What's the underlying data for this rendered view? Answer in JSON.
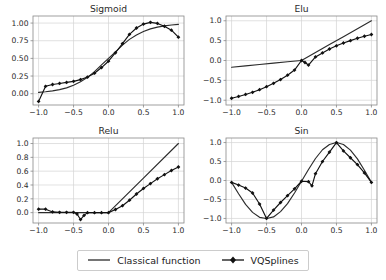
{
  "figure": {
    "background": "#ffffff",
    "line_color": "#2b2b2b",
    "marker_color": "#111111",
    "grid_color": "#d4d4d4",
    "axis_color": "#888888"
  },
  "legend": {
    "entries": [
      {
        "label": "Classical function",
        "style": "line",
        "marker": "none",
        "color": "#2b2b2b"
      },
      {
        "label": "VQSplines",
        "style": "line-marker",
        "marker": "diamond",
        "color": "#111111"
      }
    ]
  },
  "chart_data": [
    {
      "type": "line",
      "title": "Sigmoid",
      "xlabel": "",
      "ylabel": "",
      "xlim": [
        -1.08,
        1.08
      ],
      "ylim": [
        -0.16,
        1.1
      ],
      "xticks": [
        -1.0,
        -0.5,
        0.0,
        0.5,
        1.0
      ],
      "xticklabels": [
        "−1.0",
        "−0.5",
        "0.0",
        "0.5",
        "1.0"
      ],
      "yticks": [
        0.0,
        0.25,
        0.5,
        0.75,
        1.0
      ],
      "yticklabels": [
        "0.00",
        "0.25",
        "0.50",
        "0.75",
        "1.00"
      ],
      "grid": true,
      "legend_position": "figure-bottom",
      "series": [
        {
          "name": "Classical function",
          "marker": "none",
          "x": [
            -1.0,
            -0.9,
            -0.8,
            -0.7,
            -0.6,
            -0.5,
            -0.4,
            -0.3,
            -0.2,
            -0.1,
            0.0,
            0.1,
            0.2,
            0.3,
            0.4,
            0.5,
            0.6,
            0.7,
            0.8,
            0.9,
            1.0
          ],
          "y": [
            0.018,
            0.027,
            0.039,
            0.057,
            0.082,
            0.119,
            0.168,
            0.231,
            0.312,
            0.407,
            0.5,
            0.593,
            0.688,
            0.769,
            0.832,
            0.881,
            0.918,
            0.943,
            0.961,
            0.973,
            0.982
          ]
        },
        {
          "name": "VQSplines",
          "marker": "diamond",
          "x": [
            -1.0,
            -0.9,
            -0.8,
            -0.7,
            -0.6,
            -0.5,
            -0.4,
            -0.3,
            -0.2,
            -0.1,
            0.0,
            0.1,
            0.2,
            0.3,
            0.4,
            0.5,
            0.6,
            0.7,
            0.8,
            0.9,
            1.0
          ],
          "y": [
            -0.11,
            0.105,
            0.13,
            0.145,
            0.16,
            0.175,
            0.2,
            0.235,
            0.29,
            0.37,
            0.46,
            0.58,
            0.71,
            0.84,
            0.93,
            0.985,
            1.01,
            0.995,
            0.955,
            0.9,
            0.8
          ]
        }
      ]
    },
    {
      "type": "line",
      "title": "Elu",
      "xlabel": "",
      "ylabel": "",
      "xlim": [
        -1.08,
        1.08
      ],
      "ylim": [
        -1.12,
        1.12
      ],
      "xticks": [
        -1.0,
        -0.5,
        0.0,
        0.5,
        1.0
      ],
      "xticklabels": [
        "−1.0",
        "−0.5",
        "0.0",
        "0.5",
        "1.0"
      ],
      "yticks": [
        -1.0,
        -0.5,
        0.0,
        0.5,
        1.0
      ],
      "yticklabels": [
        "−1.0",
        "−0.5",
        "0.0",
        "0.5",
        "1.0"
      ],
      "grid": true,
      "legend_position": "figure-bottom",
      "series": [
        {
          "name": "Classical function",
          "marker": "none",
          "x": [
            -1.0,
            -0.8,
            -0.6,
            -0.4,
            -0.2,
            0.0,
            0.2,
            0.4,
            0.6,
            0.8,
            1.0
          ],
          "y": [
            -0.17,
            -0.135,
            -0.1,
            -0.066,
            -0.032,
            0.0,
            0.2,
            0.4,
            0.6,
            0.8,
            1.0
          ]
        },
        {
          "name": "VQSplines",
          "marker": "diamond",
          "x": [
            -1.0,
            -0.9,
            -0.8,
            -0.7,
            -0.6,
            -0.5,
            -0.4,
            -0.3,
            -0.2,
            -0.1,
            0.0,
            0.05,
            0.1,
            0.2,
            0.3,
            0.4,
            0.5,
            0.6,
            0.7,
            0.8,
            0.9,
            1.0
          ],
          "y": [
            -0.95,
            -0.905,
            -0.855,
            -0.8,
            -0.735,
            -0.66,
            -0.575,
            -0.48,
            -0.37,
            -0.24,
            0.0,
            -0.05,
            -0.115,
            0.09,
            0.19,
            0.29,
            0.37,
            0.44,
            0.5,
            0.56,
            0.61,
            0.655
          ]
        }
      ]
    },
    {
      "type": "line",
      "title": "Relu",
      "xlabel": "",
      "ylabel": "",
      "xlim": [
        -1.08,
        1.08
      ],
      "ylim": [
        -0.15,
        1.08
      ],
      "xticks": [
        -1.0,
        -0.5,
        0.0,
        0.5,
        1.0
      ],
      "xticklabels": [
        "−1.0",
        "−0.5",
        "0.0",
        "0.5",
        "1.0"
      ],
      "yticks": [
        0.0,
        0.2,
        0.4,
        0.6,
        0.8,
        1.0
      ],
      "yticklabels": [
        "0.0",
        "0.2",
        "0.4",
        "0.6",
        "0.8",
        "1.0"
      ],
      "grid": true,
      "legend_position": "figure-bottom",
      "series": [
        {
          "name": "Classical function",
          "marker": "none",
          "x": [
            -1.0,
            -0.5,
            0.0,
            0.5,
            1.0
          ],
          "y": [
            0.0,
            0.0,
            0.0,
            0.5,
            1.0
          ]
        },
        {
          "name": "VQSplines",
          "marker": "diamond",
          "x": [
            -1.0,
            -0.9,
            -0.8,
            -0.7,
            -0.6,
            -0.5,
            -0.45,
            -0.4,
            -0.35,
            -0.3,
            -0.2,
            -0.1,
            0.0,
            0.1,
            0.2,
            0.3,
            0.4,
            0.5,
            0.6,
            0.7,
            0.8,
            0.9,
            1.0
          ],
          "y": [
            0.05,
            0.05,
            0.01,
            0.005,
            0.005,
            0.005,
            -0.02,
            -0.1,
            -0.04,
            0.0,
            0.0,
            0.0,
            0.0,
            0.045,
            0.1,
            0.18,
            0.27,
            0.35,
            0.42,
            0.49,
            0.55,
            0.61,
            0.66
          ]
        }
      ]
    },
    {
      "type": "line",
      "title": "Sin",
      "xlabel": "",
      "ylabel": "",
      "xlim": [
        -1.08,
        1.08
      ],
      "ylim": [
        -1.12,
        1.12
      ],
      "xticks": [
        -1.0,
        -0.5,
        0.0,
        0.5,
        1.0
      ],
      "xticklabels": [
        "−1.0",
        "−0.5",
        "0.0",
        "0.5",
        "1.0"
      ],
      "yticks": [
        -1.0,
        -0.5,
        0.0,
        0.5,
        1.0
      ],
      "yticklabels": [
        "−1.0",
        "−0.5",
        "0.0",
        "0.5",
        "1.0"
      ],
      "grid": true,
      "legend_position": "figure-bottom",
      "series": [
        {
          "name": "Classical function",
          "marker": "none",
          "x": [
            -1.0,
            -0.9,
            -0.8,
            -0.7,
            -0.6,
            -0.5,
            -0.4,
            -0.3,
            -0.2,
            -0.1,
            0.0,
            0.1,
            0.2,
            0.3,
            0.4,
            0.5,
            0.6,
            0.7,
            0.8,
            0.9,
            1.0
          ],
          "y": [
            -0.05,
            -0.35,
            -0.63,
            -0.84,
            -0.97,
            -1.0,
            -0.96,
            -0.82,
            -0.61,
            -0.33,
            -0.02,
            0.29,
            0.58,
            0.81,
            0.95,
            1.0,
            0.95,
            0.8,
            0.57,
            0.27,
            -0.05
          ]
        },
        {
          "name": "VQSplines",
          "marker": "diamond",
          "x": [
            -1.0,
            -0.9,
            -0.8,
            -0.7,
            -0.6,
            -0.5,
            -0.4,
            -0.3,
            -0.2,
            -0.1,
            0.0,
            0.1,
            0.15,
            0.2,
            0.3,
            0.4,
            0.5,
            0.6,
            0.7,
            0.8,
            0.9,
            1.0
          ],
          "y": [
            -0.05,
            -0.12,
            -0.2,
            -0.33,
            -0.62,
            -1.0,
            -0.78,
            -0.58,
            -0.4,
            -0.22,
            -0.02,
            -0.03,
            -0.14,
            0.18,
            0.5,
            0.75,
            1.0,
            0.78,
            0.6,
            0.42,
            0.2,
            -0.05
          ]
        }
      ]
    }
  ]
}
